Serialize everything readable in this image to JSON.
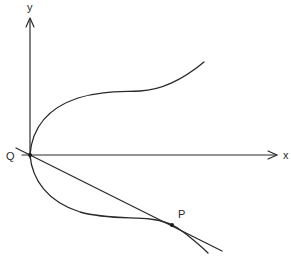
{
  "diagram": {
    "type": "curve-with-tangent",
    "axes": {
      "x_label": "x",
      "y_label": "y",
      "origin": [
        30,
        155
      ]
    },
    "points": [
      {
        "name": "Q",
        "label": "Q",
        "position": [
          30,
          155
        ]
      },
      {
        "name": "P",
        "label": "P",
        "position": [
          172,
          225
        ]
      }
    ],
    "curve": {
      "upper_branch": "from Q curving up and right, flattening then rising to the upper right",
      "lower_branch": "from Q curving down and right, flattening, then passing through P and descending"
    },
    "tangent_line": {
      "passes_through": [
        "Q",
        "P"
      ]
    },
    "colors": {
      "stroke": "#2a2a2a",
      "background": "#ffffff"
    }
  }
}
